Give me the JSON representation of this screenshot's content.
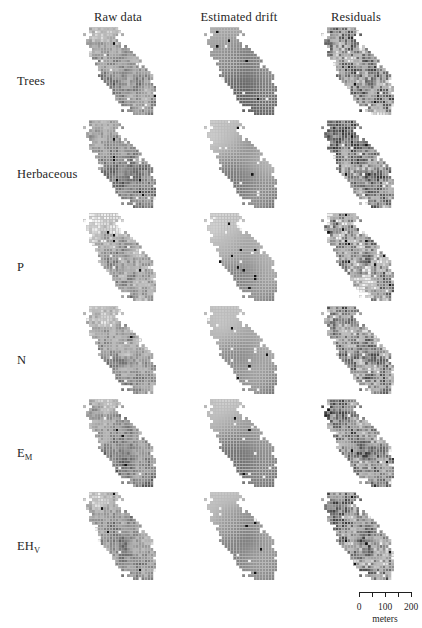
{
  "figure": {
    "width": 422,
    "height": 628,
    "background": "#ffffff",
    "text_color": "#1f1f1f"
  },
  "columns": [
    {
      "label": "Raw data",
      "kind": "raw",
      "center_x": 118,
      "x": 80
    },
    {
      "label": "Estimated drift",
      "kind": "drift",
      "center_x": 239,
      "x": 201
    },
    {
      "label": "Residuals",
      "kind": "residual",
      "center_x": 356,
      "x": 318
    }
  ],
  "column_header_y": 10,
  "rows": [
    {
      "label": "Trees",
      "sub": "",
      "y": 27,
      "label_y": 74,
      "mean": 0.46,
      "contrast": 0.95,
      "drift_mean": 0.3,
      "drift_contrast": 0.46,
      "seed": 101
    },
    {
      "label": "Herbaceous",
      "sub": "",
      "y": 120,
      "label_y": 167,
      "mean": 0.4,
      "contrast": 0.82,
      "drift_mean": 0.42,
      "drift_contrast": 0.52,
      "seed": 202
    },
    {
      "label": "P",
      "sub": "",
      "y": 213,
      "label_y": 260,
      "mean": 0.55,
      "contrast": 1.05,
      "drift_mean": 0.46,
      "drift_contrast": 0.5,
      "seed": 303
    },
    {
      "label": "N",
      "sub": "",
      "y": 306,
      "label_y": 353,
      "mean": 0.5,
      "contrast": 0.92,
      "drift_mean": 0.44,
      "drift_contrast": 0.48,
      "seed": 404
    },
    {
      "label": "E",
      "sub": "M",
      "y": 399,
      "label_y": 446,
      "mean": 0.44,
      "contrast": 0.88,
      "drift_mean": 0.38,
      "drift_contrast": 0.5,
      "seed": 505
    },
    {
      "label": "EH",
      "sub": "V",
      "y": 492,
      "label_y": 539,
      "mean": 0.48,
      "contrast": 0.9,
      "drift_mean": 0.4,
      "drift_contrast": 0.47,
      "seed": 606
    }
  ],
  "row_label_x": 17,
  "map": {
    "width": 76,
    "height": 88,
    "cols": 26,
    "rows": 30,
    "cell_size": 2.92,
    "grid_line_color": "#b9b9b9",
    "grid_line_width": 0.35,
    "palette_dark": "#101010",
    "palette_light": "#f4f4f4",
    "shape_note": "irregular diagonal polygon: narrow north-west lobe, waist, broad south-east body with detached north spur"
  },
  "scalebar": {
    "x": 352,
    "y": 592,
    "tick_labels": [
      "0",
      "100",
      "200"
    ],
    "units": "meters",
    "segments": 4,
    "bar_width_px": 52
  }
}
